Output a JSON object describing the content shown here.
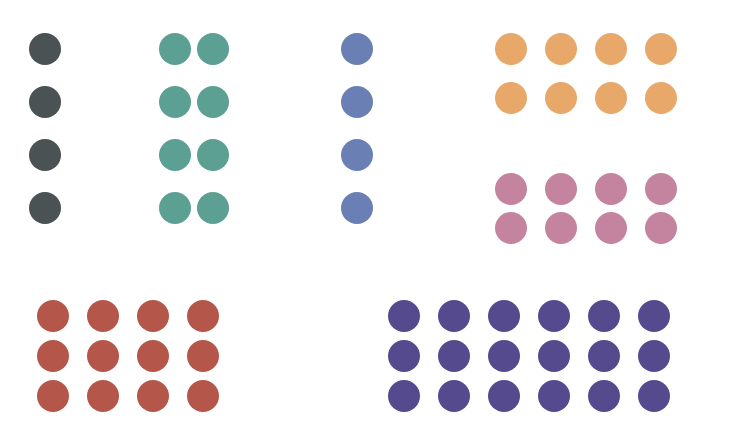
{
  "canvas": {
    "width": 729,
    "height": 447,
    "background": "#ffffff",
    "title": "Dot Grid Color Groups"
  },
  "chart_data": {
    "type": "scatter",
    "title": "",
    "subtitle": "",
    "xlabel": "",
    "ylabel": "",
    "xlim": [
      0,
      729
    ],
    "ylim": [
      0,
      447
    ],
    "grid": false,
    "legend": "none",
    "annotations": [],
    "tick_labels": {
      "x": [],
      "y": []
    },
    "marker": {
      "shape": "circle",
      "diameter_px": 32
    },
    "total_dots": 74,
    "groups": [
      {
        "name": "dark-slate-group",
        "label": "Dark Slate",
        "color": "#4a5254",
        "columns": 1,
        "rows": 4,
        "count": 4,
        "left": 29,
        "top": 33,
        "dot_size": 32,
        "col_gap": 6,
        "row_gap": 21,
        "centers_x": [
          45
        ],
        "centers_y": [
          49,
          102,
          155,
          228
        ]
      },
      {
        "name": "teal-group",
        "label": "Teal",
        "color": "#5ba093",
        "columns": 2,
        "rows": 4,
        "count": 8,
        "left": 159,
        "top": 33,
        "dot_size": 32,
        "col_gap": 6,
        "row_gap": 21,
        "centers_x": [
          175,
          213
        ],
        "centers_y": [
          49,
          102,
          155,
          228
        ]
      },
      {
        "name": "steel-blue-group",
        "label": "Steel Blue",
        "color": "#6a80b4",
        "columns": 1,
        "rows": 4,
        "count": 4,
        "left": 341,
        "top": 33,
        "dot_size": 32,
        "col_gap": 6,
        "row_gap": 21,
        "centers_x": [
          357
        ],
        "centers_y": [
          49,
          102,
          155,
          228
        ]
      },
      {
        "name": "orange-group",
        "label": "Orange",
        "color": "#e8a86a",
        "columns": 4,
        "rows": 2,
        "count": 8,
        "left": 495,
        "top": 33,
        "dot_size": 32,
        "col_gap": 18,
        "row_gap": 17,
        "centers_x": [
          511,
          561,
          611,
          661
        ],
        "centers_y": [
          49,
          98
        ]
      },
      {
        "name": "mauve-group",
        "label": "Mauve",
        "color": "#c4849f",
        "columns": 4,
        "rows": 2,
        "count": 8,
        "left": 495,
        "top": 173,
        "dot_size": 32,
        "col_gap": 18,
        "row_gap": 7,
        "centers_x": [
          511,
          561,
          611,
          661
        ],
        "centers_y": [
          189,
          228
        ]
      },
      {
        "name": "brick-red-group",
        "label": "Brick Red",
        "color": "#b4574a",
        "columns": 4,
        "rows": 3,
        "count": 12,
        "left": 37,
        "top": 300,
        "dot_size": 32,
        "col_gap": 18,
        "row_gap": 8,
        "centers_x": [
          53,
          103,
          153,
          203
        ],
        "centers_y": [
          316,
          356,
          396
        ]
      },
      {
        "name": "purple-group",
        "label": "Purple",
        "color": "#564a8f",
        "columns": 6,
        "rows": 3,
        "count": 18,
        "left": 388,
        "top": 300,
        "dot_size": 32,
        "col_gap": 18,
        "row_gap": 8,
        "centers_x": [
          404,
          454,
          504,
          554,
          604,
          654
        ],
        "centers_y": [
          316,
          356,
          396
        ]
      }
    ]
  }
}
